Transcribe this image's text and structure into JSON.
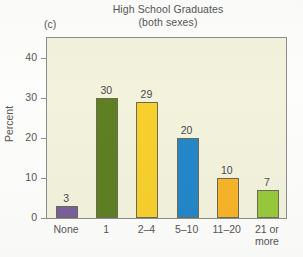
{
  "figure": {
    "panel_label": "(c)",
    "title_line1": "High School Graduates",
    "title_line2": "(both sexes)"
  },
  "chart_data": {
    "type": "bar",
    "title": "High School Graduates (both sexes)",
    "subtitle": "(c)",
    "xlabel": "",
    "ylabel": "Percent",
    "categories": [
      "None",
      "1",
      "2–4",
      "5–10",
      "11–20",
      "21 or\nmore"
    ],
    "values": [
      3,
      30,
      29,
      20,
      10,
      7
    ],
    "value_labels": [
      "3",
      "30",
      "29",
      "20",
      "10",
      "7"
    ],
    "bar_colors": [
      "#7a5f9e",
      "#5e8022",
      "#f7d02e",
      "#2487c8",
      "#f6b429",
      "#97c93d"
    ],
    "ylim": [
      0,
      45
    ],
    "yticks": [
      0,
      10,
      20,
      30,
      40
    ],
    "ytick_labels": [
      "0",
      "10",
      "20",
      "30",
      "40"
    ],
    "grid": false,
    "legend": "none",
    "plot_bgcolor": "#f2f2dd",
    "axis_color": "#8d8d8d"
  }
}
